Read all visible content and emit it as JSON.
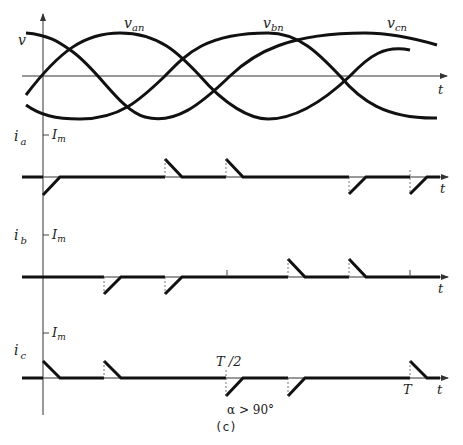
{
  "figure": {
    "caption": "(c)",
    "condition": "α > 90°",
    "colors": {
      "ink": "#111111",
      "axis": "#333333",
      "background": "#ffffff"
    }
  },
  "voltage_plot": {
    "ylabel": "v",
    "xlabel": "t",
    "curves": [
      {
        "name": "v_an",
        "label_main": "v",
        "label_sub": "an"
      },
      {
        "name": "v_bn",
        "label_main": "v",
        "label_sub": "bn"
      },
      {
        "name": "v_cn",
        "label_main": "v",
        "label_sub": "cn"
      }
    ]
  },
  "current_plots": [
    {
      "name": "i_a",
      "label_main": "i",
      "label_sub": "a",
      "level_label_main": "I",
      "level_label_sub": "m",
      "xlabel": "t"
    },
    {
      "name": "i_b",
      "label_main": "i",
      "label_sub": "b",
      "level_label_main": "I",
      "level_label_sub": "m",
      "xlabel": "t"
    },
    {
      "name": "i_c",
      "label_main": "i",
      "label_sub": "c",
      "level_label_main": "I",
      "level_label_sub": "m",
      "xlabel": "t"
    }
  ],
  "time_marks": {
    "half_period": "T /2",
    "period": "T"
  }
}
